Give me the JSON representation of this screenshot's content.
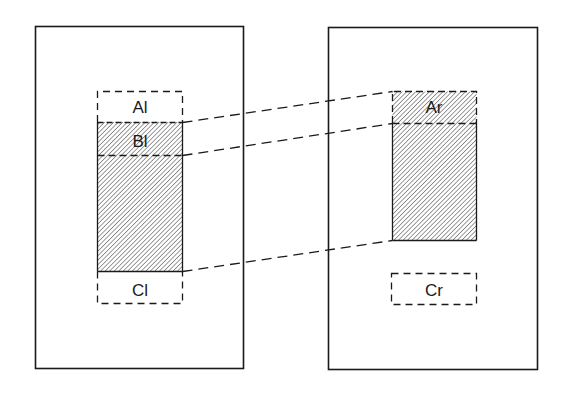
{
  "diagram": {
    "type": "region-mapping",
    "colors": {
      "stroke": "#1a1a1a",
      "background": "#ffffff",
      "hatch": "#333333"
    },
    "panels": [
      {
        "id": "left",
        "frame": {
          "x": 35,
          "y": 26,
          "w": 208,
          "h": 342
        },
        "regions": [
          {
            "id": "Al",
            "label": "Al",
            "style": "dashed",
            "hatched": false,
            "x": 97,
            "y": 91,
            "w": 85,
            "h": 31
          },
          {
            "id": "Bl",
            "label": "Bl",
            "style": "hatched",
            "hatched": true,
            "x": 97,
            "y": 122,
            "w": 85,
            "h": 33
          },
          {
            "id": "body_l",
            "label": "",
            "style": "hatched",
            "hatched": true,
            "x": 97,
            "y": 155,
            "w": 85,
            "h": 116
          },
          {
            "id": "Cl",
            "label": "Cl",
            "style": "dashed",
            "hatched": false,
            "x": 97,
            "y": 271,
            "w": 85,
            "h": 33
          }
        ]
      },
      {
        "id": "right",
        "frame": {
          "x": 328,
          "y": 27,
          "w": 209,
          "h": 343
        },
        "regions": [
          {
            "id": "Ar",
            "label": "Ar",
            "style": "hatched",
            "hatched": true,
            "x": 392,
            "y": 91,
            "w": 84,
            "h": 32
          },
          {
            "id": "body_r",
            "label": "",
            "style": "hatched",
            "hatched": true,
            "x": 392,
            "y": 123,
            "w": 84,
            "h": 117
          },
          {
            "id": "Cr",
            "label": "Cr",
            "style": "dashed",
            "hatched": false,
            "x": 391,
            "y": 273,
            "w": 85,
            "h": 32
          }
        ]
      }
    ],
    "connectors": [
      {
        "from": "Bl top",
        "x1": 182,
        "y1": 122,
        "x2": 392,
        "y2": 91
      },
      {
        "from": "Bl bottom",
        "x1": 182,
        "y1": 155,
        "x2": 392,
        "y2": 123
      },
      {
        "from": "body bottom",
        "x1": 182,
        "y1": 271,
        "x2": 392,
        "y2": 240
      }
    ],
    "labels": {
      "al": "Al",
      "bl": "Bl",
      "cl": "Cl",
      "ar": "Ar",
      "cr": "Cr"
    }
  }
}
